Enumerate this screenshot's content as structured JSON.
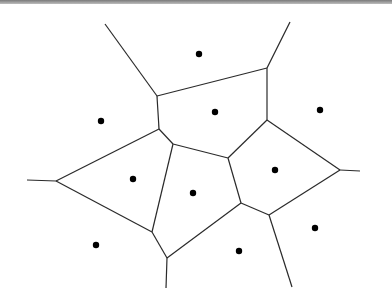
{
  "diagram": {
    "type": "voronoi",
    "colors": {
      "edge": "#2a2a2a",
      "site": "#000000",
      "background": "#ffffff"
    },
    "sites": [
      {
        "x": 199,
        "y": 54
      },
      {
        "x": 101,
        "y": 121
      },
      {
        "x": 215,
        "y": 112
      },
      {
        "x": 320,
        "y": 110
      },
      {
        "x": 133,
        "y": 179
      },
      {
        "x": 193,
        "y": 193
      },
      {
        "x": 275,
        "y": 170
      },
      {
        "x": 96,
        "y": 245
      },
      {
        "x": 239,
        "y": 251
      },
      {
        "x": 315,
        "y": 228
      }
    ],
    "edges": [
      [
        [
          105,
          24
        ],
        [
          157,
          96
        ]
      ],
      [
        [
          290,
          22
        ],
        [
          267,
          68
        ]
      ],
      [
        [
          157,
          96
        ],
        [
          267,
          68
        ]
      ],
      [
        [
          157,
          96
        ],
        [
          159,
          129
        ]
      ],
      [
        [
          267,
          68
        ],
        [
          267,
          120
        ]
      ],
      [
        [
          159,
          129
        ],
        [
          173,
          144
        ]
      ],
      [
        [
          159,
          129
        ],
        [
          56,
          181
        ]
      ],
      [
        [
          27,
          180
        ],
        [
          56,
          181
        ]
      ],
      [
        [
          56,
          181
        ],
        [
          152,
          232
        ]
      ],
      [
        [
          173,
          144
        ],
        [
          228,
          158
        ]
      ],
      [
        [
          173,
          144
        ],
        [
          152,
          232
        ]
      ],
      [
        [
          228,
          158
        ],
        [
          267,
          120
        ]
      ],
      [
        [
          267,
          120
        ],
        [
          340,
          170
        ]
      ],
      [
        [
          340,
          170
        ],
        [
          360,
          171
        ]
      ],
      [
        [
          228,
          158
        ],
        [
          241,
          203
        ]
      ],
      [
        [
          241,
          203
        ],
        [
          269,
          215
        ]
      ],
      [
        [
          269,
          215
        ],
        [
          340,
          170
        ]
      ],
      [
        [
          241,
          203
        ],
        [
          167,
          258
        ]
      ],
      [
        [
          152,
          232
        ],
        [
          167,
          258
        ]
      ],
      [
        [
          167,
          258
        ],
        [
          166,
          288
        ]
      ],
      [
        [
          269,
          215
        ],
        [
          292,
          287
        ]
      ]
    ]
  }
}
